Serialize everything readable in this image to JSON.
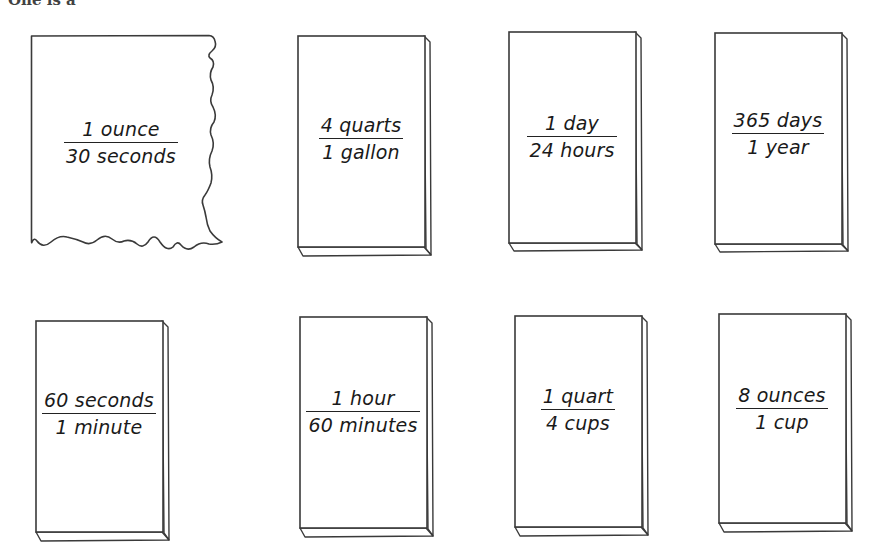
{
  "header": {
    "cut_off_text": "One is a"
  },
  "colors": {
    "stroke": "#3a3a3a",
    "card_fill": "#ffffff",
    "text": "#1a1a1a"
  },
  "cards": [
    {
      "id": "ounce-per-30-seconds",
      "numerator": "1 ounce",
      "denominator": "30 seconds",
      "style": "torn"
    },
    {
      "id": "quarts-per-gallon",
      "numerator": "4 quarts",
      "denominator": "1 gallon",
      "style": "block"
    },
    {
      "id": "day-per-24-hours",
      "numerator": "1 day",
      "denominator": "24 hours",
      "style": "block"
    },
    {
      "id": "days-per-year",
      "numerator": "365 days",
      "denominator": "1 year",
      "style": "block"
    },
    {
      "id": "seconds-per-minute",
      "numerator": "60 seconds",
      "denominator": "1 minute",
      "style": "block"
    },
    {
      "id": "hour-per-60-minutes",
      "numerator": "1 hour",
      "denominator": "60 minutes",
      "style": "block"
    },
    {
      "id": "quart-per-4-cups",
      "numerator": "1 quart",
      "denominator": "4 cups",
      "style": "block"
    },
    {
      "id": "ounces-per-cup",
      "numerator": "8 ounces",
      "denominator": "1 cup",
      "style": "block"
    }
  ]
}
